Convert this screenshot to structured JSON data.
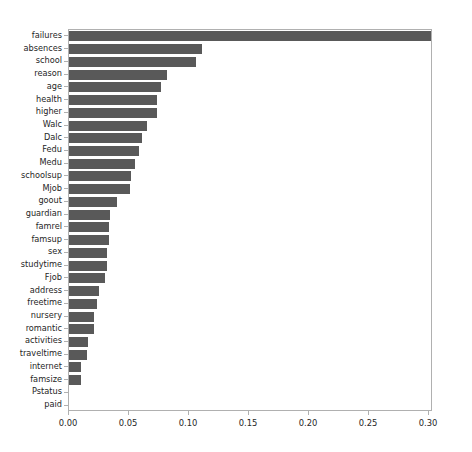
{
  "chart_data": {
    "type": "bar",
    "orientation": "horizontal",
    "title": "",
    "xlabel": "",
    "ylabel": "",
    "xlim": [
      0.0,
      0.3033
    ],
    "grid": false,
    "legend": null,
    "bar_color": "#595959",
    "background_color": "#ffffff",
    "axis_color": "#b0b0b0",
    "xticks": [
      0.0,
      0.05,
      0.1,
      0.15,
      0.2,
      0.25,
      0.3
    ],
    "xtick_labels": [
      "0.00",
      "0.05",
      "0.10",
      "0.15",
      "0.20",
      "0.25",
      "0.30"
    ],
    "categories": [
      "failures",
      "absences",
      "school",
      "reason",
      "age",
      "health",
      "higher",
      "Walc",
      "Dalc",
      "Fedu",
      "Medu",
      "schoolsup",
      "Mjob",
      "goout",
      "guardian",
      "famrel",
      "famsup",
      "sex",
      "studytime",
      "Fjob",
      "address",
      "freetime",
      "nursery",
      "romantic",
      "activities",
      "traveltime",
      "internet",
      "famsize",
      "Pstatus",
      "paid"
    ],
    "values": [
      0.304,
      0.111,
      0.106,
      0.082,
      0.077,
      0.073,
      0.073,
      0.065,
      0.061,
      0.058,
      0.055,
      0.052,
      0.051,
      0.04,
      0.034,
      0.033,
      0.033,
      0.032,
      0.032,
      0.03,
      0.025,
      0.023,
      0.021,
      0.021,
      0.016,
      0.015,
      0.01,
      0.01,
      0.0,
      0.0
    ]
  }
}
